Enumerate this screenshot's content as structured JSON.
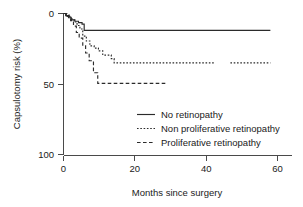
{
  "chart_data": {
    "type": "line",
    "title": "",
    "subtitle": "",
    "xlabel": "Months since surgery",
    "ylabel": "Capsulotomy risk (%)",
    "xlim": [
      0,
      62
    ],
    "ylim": [
      0,
      100
    ],
    "y_inverted": true,
    "xticks": [
      0,
      20,
      40,
      60
    ],
    "xtick_labels": [
      "0",
      "20",
      "40",
      "60"
    ],
    "yticks": [
      0,
      50,
      100
    ],
    "ytick_labels": [
      "0",
      "50",
      "100"
    ],
    "grid": false,
    "legend_position": "center-right",
    "note": "Kaplan-Meier style cumulative capsulotomy risk step curves; y-axis increases downward from 0 at top to 100 at bottom",
    "series": [
      {
        "name": "No retinopathy",
        "linestyle": "solid",
        "color": "#2b2b2b",
        "x": [
          0,
          0.6,
          0.6,
          1.4,
          1.4,
          2.2,
          2.2,
          3.2,
          3.2,
          4.2,
          4.2,
          5.2,
          5.2,
          5.8,
          5.8,
          58.0
        ],
        "y": [
          0,
          0,
          1.5,
          1.5,
          3.0,
          3.0,
          4.5,
          4.5,
          5.5,
          5.5,
          6.5,
          6.5,
          7.5,
          7.5,
          12.0,
          12.0
        ],
        "final_value": 12.0,
        "final_month": 58.0
      },
      {
        "name": "Non proliferative retinopathy",
        "linestyle": "dotted",
        "color": "#2b2b2b",
        "x": [
          0,
          0.8,
          0.8,
          1.6,
          1.6,
          2.4,
          2.4,
          3.0,
          3.0,
          3.8,
          3.8,
          4.6,
          4.6,
          5.4,
          5.4,
          6.4,
          6.4,
          7.4,
          7.4,
          8.6,
          8.6,
          9.8,
          9.8,
          11.0,
          11.0,
          13.4,
          13.4,
          14.2,
          14.2,
          42.5,
          46.8,
          58.0
        ],
        "y": [
          0,
          0,
          1.2,
          1.2,
          2.6,
          2.6,
          4.0,
          4.0,
          6.0,
          6.0,
          8.5,
          8.5,
          11.0,
          11.0,
          16.0,
          16.0,
          19.5,
          19.5,
          23.0,
          23.0,
          24.5,
          24.5,
          26.5,
          26.5,
          29.5,
          29.5,
          32.0,
          32.0,
          35.0,
          35.0,
          35.0,
          35.0
        ],
        "final_value": 35.0,
        "final_month": 58.0,
        "gap_between_months": [
          42.5,
          46.8
        ]
      },
      {
        "name": "Proliferative retinopathy",
        "linestyle": "dashed",
        "color": "#2b2b2b",
        "x": [
          0,
          1.0,
          1.0,
          2.0,
          2.0,
          2.8,
          2.8,
          3.6,
          3.6,
          4.4,
          4.4,
          5.4,
          5.4,
          6.2,
          6.2,
          7.2,
          7.2,
          8.4,
          8.4,
          9.6,
          9.6,
          29.0
        ],
        "y": [
          0,
          0,
          2.0,
          2.0,
          5.0,
          5.0,
          9.0,
          9.0,
          13.5,
          13.5,
          17.5,
          17.5,
          23.0,
          23.0,
          28.0,
          28.0,
          33.5,
          33.5,
          42.0,
          42.0,
          49.5,
          49.5
        ],
        "final_value": 49.5,
        "final_month": 29.0
      }
    ]
  },
  "legend": {
    "items": [
      {
        "label": "No retinopathy",
        "style": "solid"
      },
      {
        "label": "Non proliferative retinopathy",
        "style": "dotted"
      },
      {
        "label": "Proliferative retinopathy",
        "style": "dashed"
      }
    ]
  }
}
